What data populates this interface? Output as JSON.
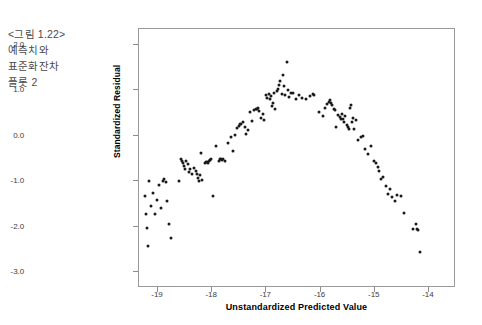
{
  "caption": {
    "lines": [
      "<그림 1.22>",
      "예측치와",
      "표준화잔차",
      "플롯 2"
    ]
  },
  "chart_data": {
    "type": "scatter",
    "title": "",
    "xlabel": "Unstandardized Predicted Value",
    "ylabel": "Standardized Residual",
    "xlim": [
      -19.35,
      -13.5
    ],
    "ylim": [
      -3.35,
      2.35
    ],
    "xticks": [
      -19,
      -18,
      -17,
      -16,
      -15,
      -14
    ],
    "xticklabels": [
      "-19",
      "-18",
      "-17",
      "-16",
      "-15",
      "-14"
    ],
    "yticks": [
      2.0,
      1.0,
      0.0,
      -1.0,
      -2.0,
      -3.0
    ],
    "yticklabels": [
      "2.0",
      "1.0",
      "0.0",
      "-1.0",
      "-2.0",
      "-3.0"
    ],
    "grid": false,
    "legend": null,
    "marker": "filled-circle",
    "marker_color": "#1a1a1a",
    "marker_size": 3,
    "n_points": 148,
    "pattern": "inverted-U (curvilinear) residual pattern",
    "points": [
      [
        -19.24,
        -1.33
      ],
      [
        -19.22,
        -1.72
      ],
      [
        -19.2,
        -2.04
      ],
      [
        -19.18,
        -2.42
      ],
      [
        -19.16,
        -1.0
      ],
      [
        -19.12,
        -1.55
      ],
      [
        -19.1,
        -1.26
      ],
      [
        -19.06,
        -1.73
      ],
      [
        -19.02,
        -1.41
      ],
      [
        -18.98,
        -1.09
      ],
      [
        -18.94,
        -1.6
      ],
      [
        -18.9,
        -1.0
      ],
      [
        -18.88,
        -0.96
      ],
      [
        -18.86,
        -1.02
      ],
      [
        -18.84,
        -1.44
      ],
      [
        -18.8,
        -1.95
      ],
      [
        -18.76,
        -2.25
      ],
      [
        -18.62,
        -0.99
      ],
      [
        -18.58,
        -0.52
      ],
      [
        -18.56,
        -0.56
      ],
      [
        -18.54,
        -0.6
      ],
      [
        -18.52,
        -0.66
      ],
      [
        -18.5,
        -0.73
      ],
      [
        -18.48,
        -0.55
      ],
      [
        -18.44,
        -0.62
      ],
      [
        -18.42,
        -0.8
      ],
      [
        -18.4,
        -0.72
      ],
      [
        -18.38,
        -0.85
      ],
      [
        -18.34,
        -0.7
      ],
      [
        -18.3,
        -0.78
      ],
      [
        -18.28,
        -0.84
      ],
      [
        -18.26,
        -0.92
      ],
      [
        -18.24,
        -1.0
      ],
      [
        -18.22,
        -0.86
      ],
      [
        -18.2,
        -0.38
      ],
      [
        -18.18,
        -0.98
      ],
      [
        -18.14,
        -0.6
      ],
      [
        -18.12,
        -0.58
      ],
      [
        -18.1,
        -0.57
      ],
      [
        -18.08,
        -0.59
      ],
      [
        -18.06,
        -0.56
      ],
      [
        -18.04,
        -0.54
      ],
      [
        -18.02,
        -0.52
      ],
      [
        -17.98,
        -1.32
      ],
      [
        -17.92,
        -0.23
      ],
      [
        -17.88,
        -0.55
      ],
      [
        -17.86,
        -0.52
      ],
      [
        -17.84,
        -0.5
      ],
      [
        -17.82,
        -0.53
      ],
      [
        -17.8,
        -0.51
      ],
      [
        -17.76,
        -0.55
      ],
      [
        -17.7,
        -0.15
      ],
      [
        -17.66,
        -0.02
      ],
      [
        -17.62,
        -0.34
      ],
      [
        -17.58,
        0.02
      ],
      [
        -17.54,
        0.18
      ],
      [
        -17.5,
        0.22
      ],
      [
        -17.48,
        0.25
      ],
      [
        -17.46,
        0.27
      ],
      [
        -17.44,
        0.3
      ],
      [
        -17.4,
        0.2
      ],
      [
        -17.38,
        0.05
      ],
      [
        -17.34,
        0.12
      ],
      [
        -17.3,
        0.52
      ],
      [
        -17.26,
        0.32
      ],
      [
        -17.22,
        0.56
      ],
      [
        -17.2,
        0.6
      ],
      [
        -17.18,
        0.58
      ],
      [
        -17.16,
        0.62
      ],
      [
        -17.14,
        0.55
      ],
      [
        -17.1,
        0.4
      ],
      [
        -17.06,
        0.48
      ],
      [
        -17.04,
        0.35
      ],
      [
        -17.0,
        0.9
      ],
      [
        -16.98,
        0.84
      ],
      [
        -16.96,
        0.92
      ],
      [
        -16.94,
        0.8
      ],
      [
        -16.92,
        0.88
      ],
      [
        -16.9,
        0.66
      ],
      [
        -16.88,
        0.72
      ],
      [
        -16.86,
        0.95
      ],
      [
        -16.84,
        0.6
      ],
      [
        -16.8,
        0.98
      ],
      [
        -16.78,
        1.04
      ],
      [
        -16.76,
        1.12
      ],
      [
        -16.74,
        1.2
      ],
      [
        -16.72,
        0.92
      ],
      [
        -16.7,
        1.34
      ],
      [
        -16.68,
        1.1
      ],
      [
        -16.66,
        0.9
      ],
      [
        -16.62,
        1.62
      ],
      [
        -16.6,
        1.0
      ],
      [
        -16.58,
        0.86
      ],
      [
        -16.54,
        0.94
      ],
      [
        -16.5,
        0.95
      ],
      [
        -16.46,
        0.82
      ],
      [
        -16.4,
        0.9
      ],
      [
        -16.34,
        0.83
      ],
      [
        -16.26,
        0.8
      ],
      [
        -16.2,
        0.88
      ],
      [
        -16.14,
        0.92
      ],
      [
        -16.12,
        0.9
      ],
      [
        -16.02,
        0.52
      ],
      [
        -15.96,
        0.44
      ],
      [
        -15.92,
        0.62
      ],
      [
        -15.88,
        0.7
      ],
      [
        -15.84,
        0.74
      ],
      [
        -15.82,
        0.78
      ],
      [
        -15.8,
        0.72
      ],
      [
        -15.78,
        0.68
      ],
      [
        -15.76,
        0.6
      ],
      [
        -15.74,
        0.56
      ],
      [
        -15.72,
        0.2
      ],
      [
        -15.68,
        0.46
      ],
      [
        -15.64,
        0.42
      ],
      [
        -15.62,
        0.38
      ],
      [
        -15.6,
        0.48
      ],
      [
        -15.58,
        0.36
      ],
      [
        -15.56,
        0.3
      ],
      [
        -15.54,
        0.44
      ],
      [
        -15.52,
        0.24
      ],
      [
        -15.5,
        0.2
      ],
      [
        -15.48,
        0.14
      ],
      [
        -15.46,
        0.62
      ],
      [
        -15.44,
        0.68
      ],
      [
        -15.42,
        0.3
      ],
      [
        -15.4,
        0.4
      ],
      [
        -15.38,
        0.16
      ],
      [
        -15.34,
        0.34
      ],
      [
        -15.3,
        -0.1
      ],
      [
        -15.26,
        -0.02
      ],
      [
        -15.22,
        0.0
      ],
      [
        -15.18,
        -0.3
      ],
      [
        -15.12,
        -0.4
      ],
      [
        -15.06,
        -0.22
      ],
      [
        -15.02,
        -0.55
      ],
      [
        -14.98,
        -0.6
      ],
      [
        -14.94,
        -0.68
      ],
      [
        -14.92,
        -0.78
      ],
      [
        -14.88,
        -0.96
      ],
      [
        -14.84,
        -0.9
      ],
      [
        -14.8,
        -1.1
      ],
      [
        -14.76,
        -1.28
      ],
      [
        -14.72,
        -1.18
      ],
      [
        -14.68,
        -1.34
      ],
      [
        -14.62,
        -1.44
      ],
      [
        -14.58,
        -1.3
      ],
      [
        -14.52,
        -1.32
      ],
      [
        -14.46,
        -1.7
      ],
      [
        -14.3,
        -2.06
      ],
      [
        -14.24,
        -1.94
      ],
      [
        -14.22,
        -2.06
      ],
      [
        -14.2,
        -2.08
      ],
      [
        -14.16,
        -2.56
      ]
    ]
  }
}
